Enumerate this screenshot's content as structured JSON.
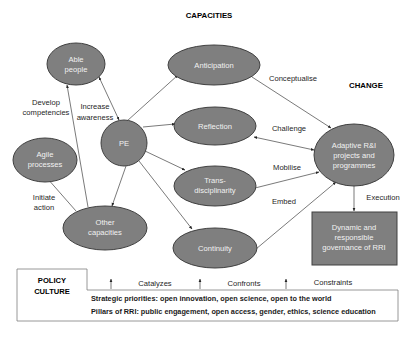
{
  "headings": {
    "capacities": "CAPACITIES",
    "change": "CHANGE"
  },
  "nodes": {
    "able_people": [
      "Able",
      "people"
    ],
    "anticipation": "Anticipation",
    "pe": "PE",
    "reflection": "Reflection",
    "agile_processes": [
      "Agile",
      "processes"
    ],
    "trans_disciplinarity": [
      "Trans-",
      "disciplinarity"
    ],
    "other_capacities": [
      "Other",
      "capacities"
    ],
    "continuity": "Continuity",
    "adaptive": [
      "Adaptive R&I",
      "projects and",
      "programmes"
    ],
    "governance": [
      "Dynamic and",
      "responsible",
      "governance of RRI"
    ]
  },
  "edge_labels": {
    "develop": [
      "Develop",
      "competencies"
    ],
    "increase": [
      "Increase",
      "awareness"
    ],
    "initiate": [
      "Initiate",
      "action"
    ],
    "conceptualise": "Conceptualise",
    "challenge": "Challenge",
    "mobilise": "Mobilise",
    "embed": "Embed",
    "execution": "Execution"
  },
  "policy": {
    "title": [
      "POLICY",
      "CULTURE"
    ],
    "arrows": [
      "Catalyzes",
      "Confronts",
      "Constraints"
    ],
    "lines": [
      "Strategic priorities: open innovation, open science, open to the world",
      "Pillars of RRI: public engagement, open access, gender, ethics, science education"
    ]
  },
  "colors": {
    "node_fill": "#7f7f7f",
    "node_stroke": "#404040",
    "node_text": "#f2f2f2",
    "edge": "#404040"
  }
}
